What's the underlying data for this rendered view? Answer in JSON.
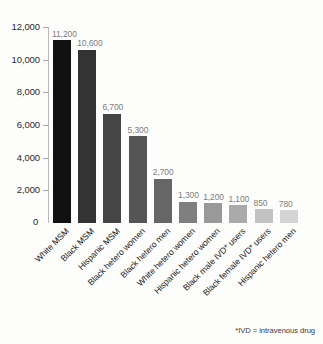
{
  "top_clipped_text": "",
  "footnote": "*IVD = intravenous drug",
  "zero_label": "0",
  "chart_data": {
    "type": "bar",
    "title": "",
    "xlabel": "",
    "ylabel": "",
    "ylim": [
      0,
      12000
    ],
    "grid": false,
    "legend": "none",
    "y_ticks": [
      "12,000",
      "10,000",
      "8,000",
      "6,000",
      "4,000",
      "2,000"
    ],
    "y_tick_values": [
      12000,
      10000,
      8000,
      6000,
      4000,
      2000
    ],
    "categories": [
      "White MSM",
      "Black MSM",
      "Hispanic MSM",
      "Black hetero women",
      "Black hetero men",
      "White hetero women",
      "Hispanic hetero women",
      "Black male IVD* users",
      "Black female IVD* users",
      "Hispanic hetero men"
    ],
    "values": [
      11200,
      10600,
      6700,
      5300,
      2700,
      1300,
      1200,
      1100,
      850,
      780
    ],
    "value_labels": [
      "11,200",
      "10,600",
      "6,700",
      "5,300",
      "2,700",
      "1,300",
      "1,200",
      "1,100",
      "850",
      "780"
    ],
    "bar_colors": [
      "#111111",
      "#333333",
      "#454545",
      "#555555",
      "#666666",
      "#7f7f7f",
      "#999999",
      "#aaaaaa",
      "#c2c2c2",
      "#d4d4d4"
    ]
  }
}
